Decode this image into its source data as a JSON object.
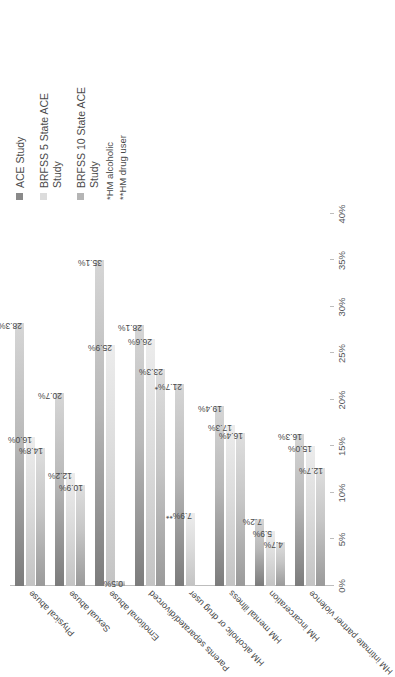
{
  "chart_data": {
    "type": "bar",
    "orientation": "horizontal",
    "title": "",
    "xlabel": "",
    "ylabel": "",
    "xlim": [
      0,
      40
    ],
    "axis_ticks": [
      "0%",
      "5%",
      "10%",
      "15%",
      "20%",
      "25%",
      "30%",
      "35%",
      "40%"
    ],
    "axis_tick_values": [
      0,
      5,
      10,
      15,
      20,
      25,
      30,
      35,
      40
    ],
    "grid": false,
    "legend_position": "right",
    "categories": [
      "Physical abuse",
      "Sexual abuse",
      "Emotional abuse",
      "Parents separated/divorced",
      "HM alcoholic or drug user",
      "HM mental illness",
      "HM incarceration",
      "HM intimate partner violence"
    ],
    "series": [
      {
        "name": "ACE Study",
        "color": "#8a8a8a",
        "values": [
          28.3,
          20.7,
          35.1,
          28.1,
          21.7,
          19.4,
          7.2,
          16.3
        ],
        "labels": [
          "28.3%",
          "20.7%",
          "35.1%",
          "28.1%",
          "21.7%*",
          "19.4%",
          "7.2%",
          "16.3%"
        ]
      },
      {
        "name": "BRFSS 5 State ACE\nStudy",
        "color": "#dcdcdc",
        "values": [
          16.0,
          12.2,
          25.9,
          26.6,
          7.9,
          17.3,
          5.9,
          15.0
        ],
        "labels": [
          "16.0%",
          "12.2%",
          "25.9%",
          "26.6%",
          "7.9%**",
          "17.3%",
          "5.9%",
          "15.0%"
        ]
      },
      {
        "name": "BRFSS 10 State ACE\nStudy",
        "color": "#b5b5b5",
        "values": [
          14.8,
          10.9,
          0.5,
          23.3,
          0,
          16.4,
          4.7,
          12.7
        ],
        "labels": [
          "14.8%",
          "10.9%",
          "0.5%",
          "23.3%",
          "",
          "16.4%",
          "4.7%",
          "12.7%"
        ]
      }
    ],
    "annotations": [
      "*HM alcoholic",
      "**HM drug user"
    ]
  },
  "legend": {
    "items": [
      {
        "label": "ACE Study",
        "color": "#8a8a8a"
      },
      {
        "label": "BRFSS 5 State ACE\nStudy",
        "color": "#dcdcdc"
      },
      {
        "label": "BRFSS 10 State ACE\nStudy",
        "color": "#b5b5b5"
      }
    ]
  },
  "footnotes": {
    "one": "*HM alcoholic",
    "two": "**HM drug user"
  }
}
